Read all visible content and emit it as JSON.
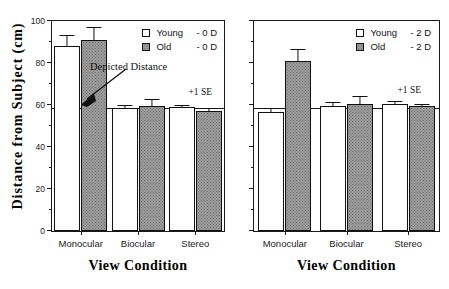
{
  "axes": {
    "y_title": "Distance from Subject (cm)",
    "x_title_left": "View Condition",
    "x_title_right": "View Condition",
    "y_ticks": [
      "0",
      "20",
      "40",
      "60",
      "80",
      "100"
    ],
    "y_min": 0,
    "y_max": 100,
    "y_minor_step": 10,
    "categories": [
      "Monocular",
      "Biocular",
      "Stereo"
    ]
  },
  "annotations": {
    "depicted_distance": "Depicted Distance",
    "se_left": "+1 SE",
    "se_right": "+1 SE",
    "reference_value": 58
  },
  "legend_left": {
    "items": [
      {
        "name": "Young",
        "condition": "- 0 D",
        "style": "young"
      },
      {
        "name": "Old",
        "condition": "- 0 D",
        "style": "old"
      }
    ]
  },
  "legend_right": {
    "items": [
      {
        "name": "Young",
        "condition": "- 2 D",
        "style": "young"
      },
      {
        "name": "Old",
        "condition": "- 2 D",
        "style": "old"
      }
    ]
  },
  "chart_data": [
    {
      "type": "bar",
      "panel": "left",
      "title": "0 D",
      "xlabel": "View Condition",
      "ylabel": "Distance from Subject (cm)",
      "ylim": [
        0,
        100
      ],
      "ytick_step": 20,
      "yminor_step": 10,
      "grid": false,
      "legend_position": "top-right",
      "reference_line": {
        "label": "Depicted Distance",
        "value": 58
      },
      "error_note": "+1 SE",
      "categories": [
        "Monocular",
        "Biocular",
        "Stereo"
      ],
      "series": [
        {
          "name": "Young - 0 D",
          "fill": "white",
          "values": [
            88,
            58.5,
            59
          ],
          "errors": [
            5,
            0.8,
            0.5
          ]
        },
        {
          "name": "Old - 0 D",
          "fill": "gray-stipple",
          "values": [
            91,
            59.5,
            57
          ],
          "errors": [
            5.5,
            3,
            1
          ]
        }
      ]
    },
    {
      "type": "bar",
      "panel": "right",
      "title": "2 D",
      "xlabel": "View Condition",
      "ylabel": "Distance from Subject (cm)",
      "ylim": [
        0,
        100
      ],
      "ytick_step": 20,
      "yminor_step": 10,
      "grid": false,
      "legend_position": "top-right",
      "reference_line": {
        "label": "Depicted Distance",
        "value": 58
      },
      "error_note": "+1 SE",
      "categories": [
        "Monocular",
        "Biocular",
        "Stereo"
      ],
      "series": [
        {
          "name": "Young - 2 D",
          "fill": "white",
          "values": [
            56.5,
            59.5,
            60.5
          ],
          "errors": [
            1.5,
            1.5,
            1
          ]
        },
        {
          "name": "Old - 2 D",
          "fill": "gray-stipple",
          "values": [
            81,
            60.5,
            59.5
          ],
          "errors": [
            5,
            3.5,
            0.5
          ]
        }
      ]
    }
  ],
  "colors": {
    "axis": "#1a1a1a",
    "young_fill": "#ffffff",
    "old_fill": "#9d9d9d",
    "text": "#111111"
  }
}
